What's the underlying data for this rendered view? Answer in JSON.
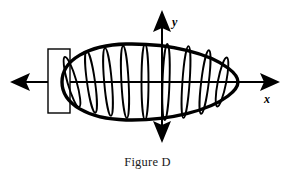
{
  "figure": {
    "caption": "Figure D",
    "background_color": "#ffffff",
    "ink_color": "#000000",
    "axes": {
      "x_label": "x",
      "y_label": "y",
      "x_axis": {
        "y_position": 82,
        "x_start": 10,
        "x_end": 280,
        "arrow_left": true,
        "arrow_right": true
      },
      "y_axis": {
        "x_position": 162,
        "y_start": 10,
        "y_end": 143,
        "arrow_up": true,
        "arrow_down": true
      },
      "origin": {
        "x": 162,
        "y": 82
      }
    },
    "solid": {
      "description": "oval solid of revolution about the x-axis",
      "left_x": 60,
      "right_x": 236,
      "center_x": 148,
      "center_y": 82,
      "top_y": 44,
      "bottom_y": 120,
      "outline_width": 3.2
    },
    "end_cap_rectangle": {
      "description": "representative rectangle at the left end of the solid",
      "x": 48,
      "y": 49,
      "width": 22,
      "height": 64,
      "stroke_width": 1.4
    },
    "disks": {
      "count": 9,
      "description": "vertical elliptical cross-section disks slicing the solid",
      "stroke_width": 1.8,
      "slices": [
        {
          "cx": 72,
          "ry": 26,
          "rx": 4.5,
          "tilt": -16
        },
        {
          "cx": 91,
          "ry": 31,
          "rx": 4.0,
          "tilt": -8
        },
        {
          "cx": 108,
          "ry": 34,
          "rx": 3.8,
          "tilt": -5
        },
        {
          "cx": 125,
          "ry": 36,
          "rx": 3.6,
          "tilt": -3
        },
        {
          "cx": 145,
          "ry": 38,
          "rx": 3.5,
          "tilt": 0
        },
        {
          "cx": 166,
          "ry": 38,
          "rx": 3.5,
          "tilt": 2
        },
        {
          "cx": 186,
          "ry": 36,
          "rx": 3.6,
          "tilt": 4
        },
        {
          "cx": 205,
          "ry": 32,
          "rx": 3.8,
          "tilt": 7
        },
        {
          "cx": 222,
          "ry": 25,
          "rx": 4.2,
          "tilt": 11
        }
      ]
    }
  }
}
